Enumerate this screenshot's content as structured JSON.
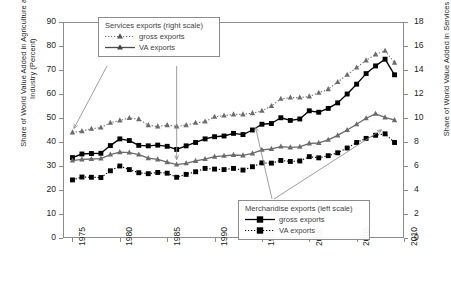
{
  "axes": {
    "ylabel_left": "Share of World Value Added in Agriculture and Industry (Percent)",
    "ylabel_right": "Share of World Value Added in Services (Percent)",
    "yticks_left": [
      "0",
      "10",
      "20",
      "30",
      "40",
      "50",
      "60",
      "70",
      "80",
      "90"
    ],
    "yticks_right": [
      "0",
      "2",
      "4",
      "6",
      "8",
      "10",
      "12",
      "14",
      "16",
      "18"
    ],
    "xticks": [
      "1975",
      "1980",
      "1985",
      "1990",
      "1995",
      "2000",
      "2005",
      "2010"
    ]
  },
  "legend_services": {
    "title": "Services exports (right scale)",
    "gross_label": "gross exports",
    "va_label": "VA exports"
  },
  "legend_merchandise": {
    "title": "Merchandise exports (left scale)",
    "gross_label": "gross exports",
    "va_label": "VA exports"
  },
  "colors": {
    "merchandise": "#000000",
    "services": "#6b6b6b",
    "axis": "#8c8c8c",
    "text": "#231f20",
    "legend_text": "#3f3f3f"
  },
  "chart_data": {
    "type": "line",
    "title": "",
    "xlabel": "",
    "ylabel": "Share of World Value Added in Agriculture and Industry (Percent)",
    "ylabel_secondary": "Share of World Value Added in Services (Percent)",
    "ylim": [
      0,
      90
    ],
    "ylim_secondary": [
      0,
      18
    ],
    "xlim": [
      1974,
      2010
    ],
    "grid": false,
    "legend_position": "inside",
    "x": [
      1975,
      1976,
      1977,
      1978,
      1979,
      1980,
      1981,
      1982,
      1983,
      1984,
      1985,
      1986,
      1987,
      1988,
      1989,
      1990,
      1991,
      1992,
      1993,
      1994,
      1995,
      1996,
      1997,
      1998,
      1999,
      2000,
      2001,
      2002,
      2003,
      2004,
      2005,
      2006,
      2007,
      2008,
      2009
    ],
    "series": [
      {
        "name": "Merchandise gross exports (left scale)",
        "axis": "left",
        "marker": "filled-square",
        "line": "solid",
        "color": "#000000",
        "values": [
          33.5,
          35.0,
          35.2,
          35.3,
          38.5,
          41.3,
          40.6,
          38.6,
          38.4,
          38.7,
          38.2,
          36.9,
          38.4,
          39.8,
          41.3,
          42.2,
          42.5,
          43.6,
          43.1,
          45.0,
          47.4,
          47.7,
          50.1,
          49.0,
          49.6,
          53.0,
          52.4,
          54.0,
          56.3,
          60.0,
          64.1,
          68.5,
          71.7,
          74.5,
          68.0
        ]
      },
      {
        "name": "Merchandise VA exports (left scale)",
        "axis": "left",
        "marker": "filled-square",
        "line": "dotted",
        "color": "#000000",
        "values": [
          24.2,
          25.4,
          25.3,
          25.2,
          28.0,
          30.0,
          28.5,
          27.2,
          26.8,
          27.3,
          27.0,
          25.3,
          26.5,
          27.6,
          29.0,
          28.7,
          28.5,
          29.0,
          28.3,
          29.7,
          31.3,
          31.2,
          32.3,
          31.9,
          32.1,
          33.9,
          33.4,
          34.3,
          35.5,
          37.5,
          39.8,
          41.5,
          42.8,
          43.4,
          39.8
        ]
      },
      {
        "name": "Services gross exports (right scale)",
        "axis": "right",
        "marker": "filled-triangle",
        "line": "dotted",
        "color": "#6b6b6b",
        "values": [
          8.8,
          8.9,
          9.1,
          9.2,
          9.6,
          9.8,
          10.0,
          9.9,
          9.4,
          9.3,
          9.4,
          9.3,
          9.4,
          9.6,
          9.7,
          10.1,
          10.2,
          10.3,
          10.3,
          10.4,
          10.6,
          11.0,
          11.6,
          11.7,
          11.7,
          11.8,
          12.1,
          12.4,
          13.0,
          13.6,
          14.2,
          14.8,
          15.3,
          15.6,
          14.6
        ]
      },
      {
        "name": "Services VA exports (right scale)",
        "axis": "right",
        "marker": "filled-triangle",
        "line": "solid",
        "color": "#6b6b6b",
        "values": [
          6.45,
          6.55,
          6.58,
          6.62,
          6.95,
          7.15,
          7.12,
          6.95,
          6.65,
          6.55,
          6.32,
          6.12,
          6.22,
          6.42,
          6.58,
          6.78,
          6.85,
          6.92,
          6.88,
          7.05,
          7.35,
          7.42,
          7.62,
          7.55,
          7.6,
          7.88,
          7.92,
          8.18,
          8.55,
          9.0,
          9.48,
          9.98,
          10.35,
          10.05,
          9.82
        ]
      }
    ],
    "annotations": [
      {
        "text": "Services exports (right scale)",
        "type": "leader-box",
        "points_to": [
          1975,
          1981
        ]
      },
      {
        "text": "Merchandise exports (left scale)",
        "type": "leader-box",
        "points_to": [
          1994,
          2008
        ]
      }
    ]
  }
}
